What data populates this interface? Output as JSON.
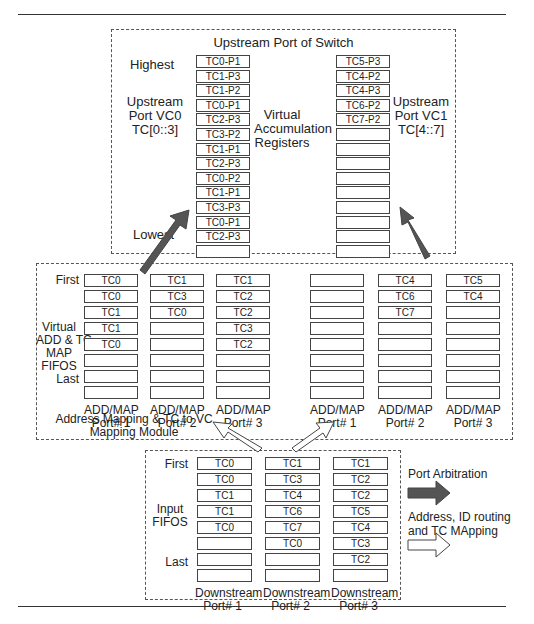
{
  "upstream": {
    "title": "Upstream Port of Switch",
    "highest_label": "Highest",
    "lowest_label": "Lowest",
    "vc0_label": [
      "Upstream",
      "Port VC0",
      "TC[0::3]"
    ],
    "vc1_label": [
      "Upstream",
      "Port VC1",
      "TC[4::7]"
    ],
    "center_label": [
      "Virtual",
      "Accumulation",
      "Registers"
    ],
    "vc0_registers": [
      "TC0-P1",
      "TC1-P3",
      "TC1-P2",
      "TC0-P1",
      "TC2-P3",
      "TC3-P2",
      "TC1-P1",
      "TC2-P3",
      "TC0-P2",
      "TC1-P1",
      "TC3-P3",
      "TC0-P1",
      "TC2-P3",
      ""
    ],
    "vc1_registers": [
      "TC5-P3",
      "TC4-P2",
      "TC4-P3",
      "TC6-P2",
      "TC7-P2",
      "",
      "",
      "",
      "",
      "",
      "",
      "",
      "",
      ""
    ]
  },
  "mapping_module": {
    "title": [
      "Address Mapping & TC to VC",
      "Mapping Module"
    ],
    "first_label": "First",
    "last_label": "Last",
    "fifo_label": [
      "Virtual",
      "ADD & TC",
      "MAP",
      "FIFOS"
    ],
    "vc0_group": [
      {
        "label": [
          "ADD/MAP",
          "Port# 1"
        ],
        "cells": [
          "TC0",
          "TC0",
          "TC1",
          "TC1",
          "TC0",
          "",
          "",
          ""
        ]
      },
      {
        "label": [
          "ADD/MAP",
          "Port# 2"
        ],
        "cells": [
          "TC1",
          "TC3",
          "TC0",
          "",
          "",
          "",
          "",
          ""
        ]
      },
      {
        "label": [
          "ADD/MAP",
          "Port# 3"
        ],
        "cells": [
          "TC1",
          "TC2",
          "TC2",
          "TC3",
          "TC2",
          "",
          "",
          ""
        ]
      }
    ],
    "vc1_group": [
      {
        "label": [
          "ADD/MAP",
          "Port# 1"
        ],
        "cells": [
          "",
          "",
          "",
          "",
          "",
          "",
          "",
          ""
        ]
      },
      {
        "label": [
          "ADD/MAP",
          "Port# 2"
        ],
        "cells": [
          "TC4",
          "TC6",
          "TC7",
          "",
          "",
          "",
          "",
          ""
        ]
      },
      {
        "label": [
          "ADD/MAP",
          "Port# 3"
        ],
        "cells": [
          "TC5",
          "TC4",
          "",
          "",
          "",
          "",
          "",
          ""
        ]
      }
    ]
  },
  "downstream": {
    "first_label": "First",
    "last_label": "Last",
    "fifo_label": [
      "Input",
      "FIFOS"
    ],
    "ports": [
      {
        "label": [
          "Downstream",
          "Port# 1"
        ],
        "cells": [
          "TC0",
          "TC0",
          "TC1",
          "TC1",
          "TC0",
          "",
          "",
          ""
        ]
      },
      {
        "label": [
          "Downstream",
          "Port# 2"
        ],
        "cells": [
          "TC1",
          "TC3",
          "TC4",
          "TC6",
          "TC7",
          "TC0",
          "",
          ""
        ]
      },
      {
        "label": [
          "Downstream",
          "Port# 3"
        ],
        "cells": [
          "TC1",
          "TC2",
          "TC2",
          "TC5",
          "TC4",
          "TC3",
          "TC2",
          ""
        ]
      }
    ]
  },
  "legend": {
    "port_arbitration": "Port Arbitration",
    "address_routing": [
      "Address, ID routing",
      "and TC MApping"
    ],
    "arbitration_arrow_color": "#555555",
    "routing_arrow_color": "#ffffff"
  }
}
